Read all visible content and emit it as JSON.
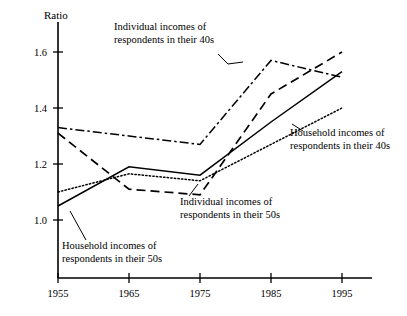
{
  "chart_data": {
    "type": "line",
    "title": "",
    "ylabel": "Ratio",
    "xlabel": "",
    "categories": [
      "1955",
      "1965",
      "1975",
      "1985",
      "1995"
    ],
    "x": [
      1955,
      1965,
      1975,
      1985,
      1995
    ],
    "ylim": [
      0.88,
      1.68
    ],
    "xlim": [
      1951,
      2000
    ],
    "yticks": [
      "1.0",
      "1.2",
      "1.4",
      "1.6"
    ],
    "ytick_values": [
      1.0,
      1.2,
      1.4,
      1.6
    ],
    "xticks": [
      "1955",
      "1965",
      "1975",
      "1985",
      "1995"
    ],
    "grid": false,
    "legend_position": "inline-annotations",
    "series": [
      {
        "name": "Individual incomes of respondents in their 40s",
        "style": "dash-dot",
        "values": [
          1.33,
          1.3,
          1.27,
          1.57,
          1.51
        ]
      },
      {
        "name": "Individual incomes of respondents in their 50s",
        "style": "dashed",
        "values": [
          1.31,
          1.11,
          1.09,
          1.45,
          1.6
        ]
      },
      {
        "name": "Household incomes of respondents in their 50s",
        "style": "solid",
        "values": [
          1.05,
          1.19,
          1.16,
          1.35,
          1.53
        ]
      },
      {
        "name": "Household incomes of respondents in their 40s",
        "style": "dotted",
        "values": [
          1.1,
          1.165,
          1.14,
          1.27,
          1.4
        ]
      }
    ],
    "annotations": [
      {
        "id": "annot-individual-40s",
        "line1": "Individual incomes of",
        "line2": "respondents in their 40s"
      },
      {
        "id": "annot-household-40s",
        "line1": "Household incomes of",
        "line2": "respondents in their 40s"
      },
      {
        "id": "annot-individual-50s",
        "line1": "Individual incomes of",
        "line2": "respondents in their 50s"
      },
      {
        "id": "annot-household-50s",
        "line1": "Household incomes of",
        "line2": "respondents in their 50s"
      }
    ],
    "colors": {
      "axis": "#000000",
      "line": "#000000",
      "background": "#ffffff"
    }
  },
  "axis": {
    "y_title": "Ratio",
    "ytick_1": "1.6",
    "ytick_2": "1.4",
    "ytick_3": "1.2",
    "ytick_4": "1.0",
    "xtick_1": "1955",
    "xtick_2": "1965",
    "xtick_3": "1975",
    "xtick_4": "1985",
    "xtick_5": "1995"
  },
  "annotations": {
    "individual_40s_line1": "Individual incomes of",
    "individual_40s_line2": "respondents in their 40s",
    "household_40s_line1": "Household incomes of",
    "household_40s_line2": "respondents in their 40s",
    "individual_50s_line1": "Individual incomes of",
    "individual_50s_line2": "respondents in their 50s",
    "household_50s_line1": "Household incomes of",
    "household_50s_line2": "respondents in their 50s"
  }
}
